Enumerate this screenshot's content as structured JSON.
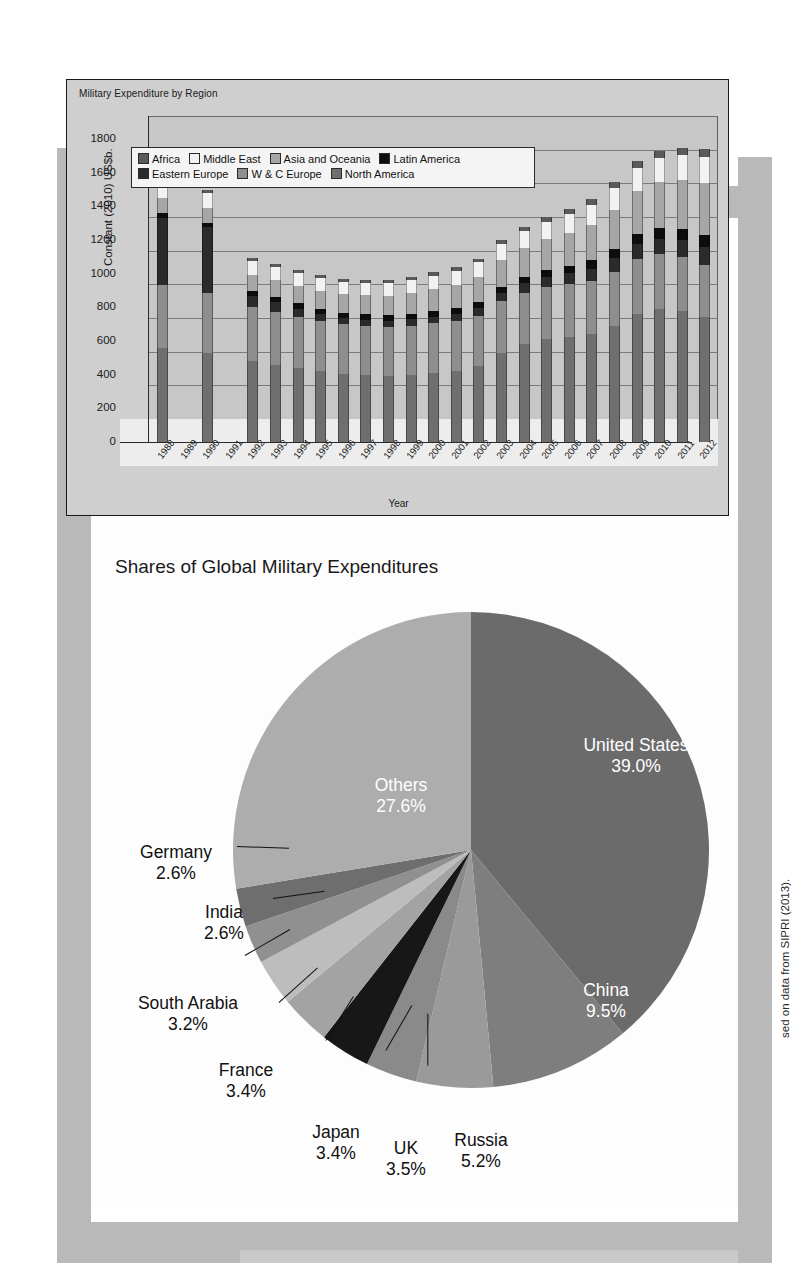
{
  "page": {
    "credit": "sed on data from SIPRI (2013)."
  },
  "bar_panel": {
    "title": "Military Expenditure by Region"
  },
  "pie_panel": {
    "title": "Shares of Global Military Expenditures"
  },
  "chart_data": [
    {
      "type": "bar",
      "stacked": true,
      "title": "Military Expenditure by Region",
      "xlabel": "Year",
      "ylabel": "Constant (2010) US$b.",
      "ylim": [
        0,
        1800
      ],
      "yticks": [
        0,
        200,
        400,
        600,
        800,
        1000,
        1200,
        1400,
        1600,
        1800
      ],
      "grid": true,
      "legend_position": "top-center",
      "categories": [
        "1988",
        "1989",
        "1990",
        "1991",
        "1992",
        "1993",
        "1994",
        "1995",
        "1996",
        "1997",
        "1998",
        "1999",
        "2000",
        "2001",
        "2002",
        "2003",
        "2004",
        "2005",
        "2006",
        "2007",
        "2008",
        "2009",
        "2010",
        "2011",
        "2012"
      ],
      "series": [
        {
          "name": "North America",
          "color": "#6f6f6f",
          "values": [
            560,
            0,
            530,
            0,
            480,
            460,
            440,
            420,
            405,
            400,
            395,
            400,
            410,
            420,
            450,
            530,
            580,
            610,
            625,
            640,
            690,
            760,
            790,
            780,
            740
          ]
        },
        {
          "name": "W & C Europe",
          "color": "#8e8e8e",
          "values": [
            375,
            0,
            355,
            0,
            320,
            312,
            305,
            300,
            295,
            292,
            290,
            292,
            295,
            298,
            300,
            305,
            308,
            310,
            312,
            315,
            320,
            325,
            325,
            318,
            312
          ]
        },
        {
          "name": "Eastern Europe",
          "color": "#2b2b2b",
          "values": [
            395,
            0,
            390,
            0,
            68,
            60,
            48,
            40,
            36,
            34,
            33,
            36,
            40,
            44,
            48,
            52,
            56,
            60,
            66,
            74,
            84,
            90,
            94,
            100,
            108
          ]
        },
        {
          "name": "Latin America",
          "color": "#0d0d0d",
          "values": [
            28,
            0,
            26,
            0,
            30,
            30,
            30,
            31,
            32,
            33,
            34,
            34,
            35,
            36,
            36,
            37,
            39,
            42,
            45,
            50,
            55,
            58,
            62,
            65,
            68
          ]
        },
        {
          "name": "Asia and Oceania",
          "color": "#a6a6a6",
          "values": [
            92,
            0,
            90,
            0,
            96,
            100,
            104,
            108,
            112,
            116,
            118,
            122,
            128,
            135,
            146,
            158,
            170,
            182,
            196,
            212,
            232,
            258,
            276,
            292,
            312
          ]
        },
        {
          "name": "Middle East",
          "color": "#f2f2f2",
          "values": [
            62,
            0,
            88,
            0,
            80,
            78,
            76,
            74,
            72,
            72,
            73,
            76,
            80,
            84,
            88,
            94,
            100,
            106,
            112,
            120,
            130,
            138,
            142,
            148,
            156
          ]
        },
        {
          "name": "Africa",
          "color": "#5a5a5a",
          "values": [
            18,
            0,
            18,
            0,
            17,
            17,
            17,
            17,
            17,
            18,
            18,
            19,
            20,
            21,
            22,
            24,
            26,
            28,
            30,
            32,
            35,
            38,
            40,
            42,
            44
          ]
        }
      ]
    },
    {
      "type": "pie",
      "title": "Shares of Global Military Expenditures",
      "unit": "%",
      "start_angle": 0,
      "direction": "clockwise",
      "slices": [
        {
          "label": "United States",
          "value": 39.0,
          "display": "39.0%",
          "color": "#6b6b6b",
          "label_placement": "inside"
        },
        {
          "label": "China",
          "value": 9.5,
          "display": "9.5%",
          "color": "#7e7e7e",
          "label_placement": "inside"
        },
        {
          "label": "Russia",
          "value": 5.2,
          "display": "5.2%",
          "color": "#9a9a9a",
          "label_placement": "callout"
        },
        {
          "label": "UK",
          "value": 3.5,
          "display": "3.5%",
          "color": "#8a8a8a",
          "label_placement": "callout"
        },
        {
          "label": "Japan",
          "value": 3.4,
          "display": "3.4%",
          "color": "#171717",
          "label_placement": "callout"
        },
        {
          "label": "France",
          "value": 3.4,
          "display": "3.4%",
          "color": "#a3a3a3",
          "label_placement": "callout"
        },
        {
          "label": "South Arabia",
          "value": 3.2,
          "display": "3.2%",
          "color": "#bdbdbd",
          "label_placement": "callout"
        },
        {
          "label": "India",
          "value": 2.6,
          "display": "2.6%",
          "color": "#909090",
          "label_placement": "callout"
        },
        {
          "label": "Germany",
          "value": 2.6,
          "display": "2.6%",
          "color": "#6e6e6e",
          "label_placement": "callout"
        },
        {
          "label": "Others",
          "value": 27.6,
          "display": "27.6%",
          "color": "#adadad",
          "label_placement": "inside"
        }
      ]
    }
  ]
}
